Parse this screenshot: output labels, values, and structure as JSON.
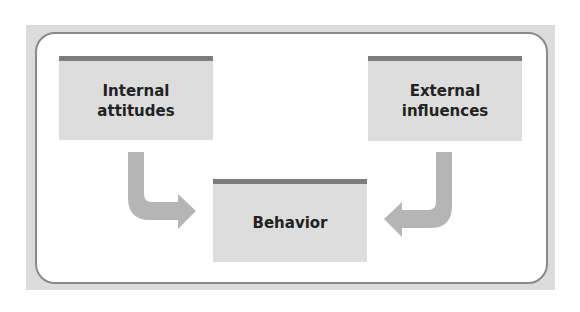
{
  "diagram": {
    "boxes": {
      "internal": {
        "line1": "Internal",
        "line2": "attitudes"
      },
      "external": {
        "line1": "External",
        "line2": "influences"
      },
      "behavior": {
        "label": "Behavior"
      }
    },
    "arrows": [
      {
        "from": "Internal attitudes",
        "to": "Behavior"
      },
      {
        "from": "External influences",
        "to": "Behavior"
      }
    ],
    "colors": {
      "frame": "#dcdcdc",
      "panel_border": "#8a8a8a",
      "box_fill": "#dddddd",
      "box_top_bar": "#7d7d7d",
      "arrow": "#b5b5b5"
    }
  }
}
